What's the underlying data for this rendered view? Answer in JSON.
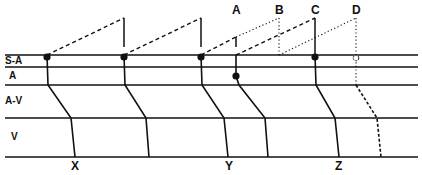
{
  "diagram": {
    "row_labels": {
      "sa": "S-A",
      "a": "A",
      "av": "A-V",
      "v": "V"
    },
    "top_labels": {
      "a": "A",
      "b": "B",
      "c": "C",
      "d": "D"
    },
    "bottom_labels": {
      "x": "X",
      "y": "Y",
      "z": "Z"
    },
    "colors": {
      "ink": "#111111",
      "background": "#ffffff"
    }
  }
}
